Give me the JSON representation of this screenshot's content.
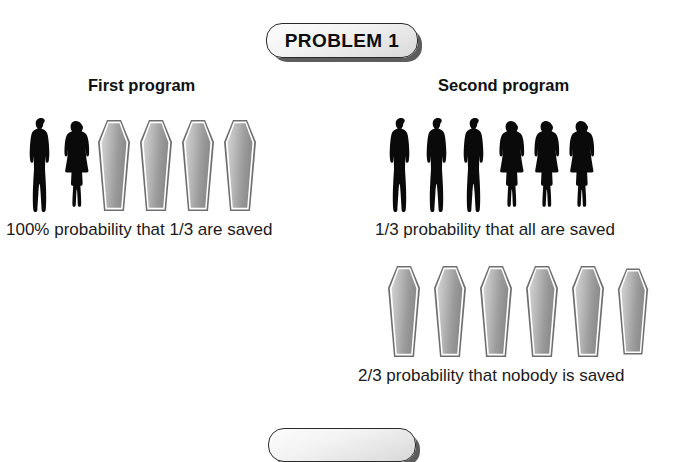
{
  "page": {
    "background_color": "#ffffff",
    "text_color": "#1a1a1a"
  },
  "badges": {
    "top": {
      "label": "PROBLEM 1",
      "fill_color": "#eeeeee",
      "border_color": "#2a2a2a",
      "shadow_color": "#5d5d5d"
    },
    "bottom": {
      "label": "",
      "visible_partial": true,
      "fill_color": "#eeeeee",
      "border_color": "#2a2a2a",
      "shadow_color": "#5d5d5d"
    }
  },
  "columns": [
    {
      "heading": "First program",
      "rows": [
        {
          "caption": "100% probability that 1/3 are saved",
          "icons": [
            "person-male",
            "person-female",
            "coffin",
            "coffin",
            "coffin",
            "coffin"
          ],
          "people_count": 2,
          "coffin_count": 4,
          "total": 6
        }
      ]
    },
    {
      "heading": "Second program",
      "rows": [
        {
          "caption": "1/3 probability that all are saved",
          "icons": [
            "person-male",
            "person-male",
            "person-male",
            "person-female",
            "person-female",
            "person-female"
          ],
          "people_count": 6,
          "coffin_count": 0,
          "total": 6
        },
        {
          "caption": "2/3 probability that nobody is saved",
          "icons": [
            "coffin",
            "coffin",
            "coffin",
            "coffin",
            "coffin",
            "coffin"
          ],
          "people_count": 0,
          "coffin_count": 6,
          "total": 6
        }
      ]
    }
  ],
  "icon_colors": {
    "silhouette": "#0a0a0a",
    "coffin_outer_border": "#6e6e6e",
    "coffin_inner_outline": "#ffffff",
    "coffin_fill_light": "#cfcfcf",
    "coffin_fill_dark": "#8d8d8d"
  }
}
